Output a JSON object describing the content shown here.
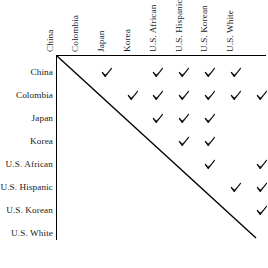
{
  "figure": {
    "name": "similarity-judgement-matrix",
    "columns": [
      "China",
      "Colombia",
      "Japan",
      "Korea",
      "U.S. African",
      "U.S. Hispanic",
      "U.S. Korean",
      "U.S. White"
    ],
    "rows": [
      "China",
      "Colombia",
      "Japan",
      "Korea",
      "U.S. African",
      "U.S. Hispanic",
      "U.S. Korean",
      "U.S. White"
    ],
    "mark_glyph": "check-mark",
    "line_color": "#000000",
    "text_color": "#1a1a1a",
    "background_color": "#ffffff"
  },
  "chart_data": {
    "type": "heatmap",
    "title": "",
    "xlabel": "",
    "ylabel": "",
    "categories": [
      "China",
      "Colombia",
      "Japan",
      "Korea",
      "U.S. African",
      "U.S. Hispanic",
      "U.S. Korean",
      "U.S. White"
    ],
    "legend": [],
    "grid": false,
    "matrix": [
      [
        0,
        1,
        0,
        1,
        1,
        1,
        1,
        0
      ],
      [
        0,
        0,
        1,
        1,
        1,
        1,
        1,
        1
      ],
      [
        0,
        0,
        0,
        1,
        1,
        1,
        0,
        0
      ],
      [
        0,
        0,
        0,
        0,
        1,
        1,
        0,
        0
      ],
      [
        0,
        0,
        0,
        0,
        0,
        1,
        0,
        1
      ],
      [
        0,
        0,
        0,
        0,
        0,
        0,
        1,
        1
      ],
      [
        0,
        0,
        0,
        0,
        0,
        0,
        0,
        1
      ],
      [
        0,
        0,
        0,
        0,
        0,
        0,
        0,
        0
      ]
    ],
    "marked_pairs": [
      [
        "China",
        "Colombia"
      ],
      [
        "China",
        "Korea"
      ],
      [
        "China",
        "U.S. African"
      ],
      [
        "China",
        "U.S. Hispanic"
      ],
      [
        "China",
        "U.S. Korean"
      ],
      [
        "Colombia",
        "Japan"
      ],
      [
        "Colombia",
        "Korea"
      ],
      [
        "Colombia",
        "U.S. African"
      ],
      [
        "Colombia",
        "U.S. Hispanic"
      ],
      [
        "Colombia",
        "U.S. Korean"
      ],
      [
        "Colombia",
        "U.S. White"
      ],
      [
        "Japan",
        "Korea"
      ],
      [
        "Japan",
        "U.S. African"
      ],
      [
        "Japan",
        "U.S. Hispanic"
      ],
      [
        "Korea",
        "U.S. African"
      ],
      [
        "Korea",
        "U.S. Hispanic"
      ],
      [
        "U.S. African",
        "U.S. Hispanic"
      ],
      [
        "U.S. African",
        "U.S. White"
      ],
      [
        "U.S. Hispanic",
        "U.S. Korean"
      ],
      [
        "U.S. Hispanic",
        "U.S. White"
      ],
      [
        "U.S. Korean",
        "U.S. White"
      ]
    ],
    "mark_count": 21
  },
  "geometry": {
    "origin_x": 56,
    "origin_y": 55,
    "col_step": 25.8,
    "col_first_center": 81,
    "row_step": 23.0,
    "row_first_center": 73,
    "diagonal_end_x": 256,
    "diagonal_end_y": 238
  }
}
